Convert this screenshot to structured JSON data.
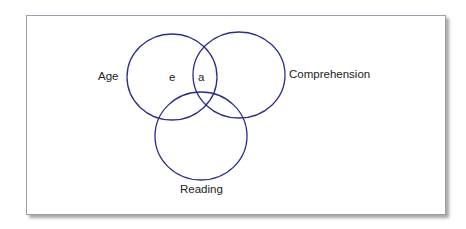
{
  "diagram": {
    "type": "venn",
    "stroke_color": "#2b2f8a",
    "sets": [
      {
        "label": "Age",
        "cx": 172,
        "cy": 77,
        "rx": 45,
        "ry": 43
      },
      {
        "label": "Comprehension",
        "cx": 239,
        "cy": 75,
        "rx": 46,
        "ry": 43
      },
      {
        "label": "Reading",
        "cx": 201,
        "cy": 136,
        "rx": 46,
        "ry": 44
      }
    ],
    "region_labels": {
      "e": "e",
      "a": "a"
    }
  }
}
